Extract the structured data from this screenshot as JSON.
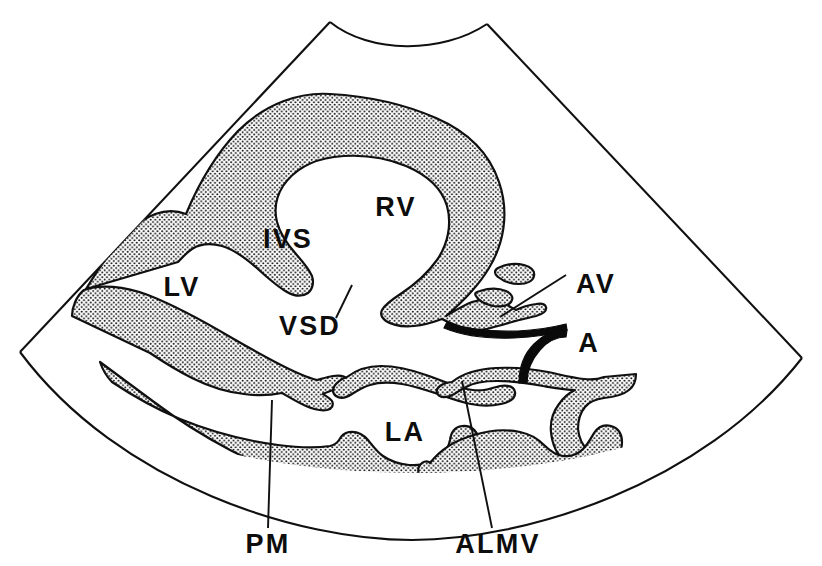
{
  "figure": {
    "kind": "echocardiogram-line-diagram",
    "background_color": "#ffffff",
    "ink_color": "#101010",
    "tissue_fill": "stippled"
  },
  "annotations": [
    {
      "id": "rv",
      "label": "RV",
      "x": 396,
      "y": 216,
      "anchor": "middle",
      "has_leader": false
    },
    {
      "id": "ivs",
      "label": "IVS",
      "x": 288,
      "y": 248,
      "anchor": "middle",
      "has_leader": false
    },
    {
      "id": "lv",
      "label": "LV",
      "x": 182,
      "y": 296,
      "anchor": "middle",
      "has_leader": false
    },
    {
      "id": "vsd",
      "label": "VSD",
      "x": 310,
      "y": 335,
      "anchor": "middle",
      "has_leader": true
    },
    {
      "id": "av",
      "label": "AV",
      "x": 596,
      "y": 293,
      "anchor": "middle",
      "has_leader": true
    },
    {
      "id": "a",
      "label": "A",
      "x": 589,
      "y": 352,
      "anchor": "middle",
      "has_leader": false
    },
    {
      "id": "la",
      "label": "LA",
      "x": 405,
      "y": 441,
      "anchor": "middle",
      "has_leader": false
    },
    {
      "id": "pm",
      "label": "PM",
      "x": 268,
      "y": 553,
      "anchor": "middle",
      "has_leader": true
    },
    {
      "id": "almv",
      "label": "ALMV",
      "x": 498,
      "y": 553,
      "anchor": "middle",
      "has_leader": true
    }
  ],
  "legend_expansions": {
    "RV": "right ventricle",
    "IVS": "interventricular septum",
    "LV": "left ventricle",
    "VSD": "ventricular septal defect",
    "AV": "aortic valve",
    "A": "aorta",
    "LA": "left atrium",
    "PM": "papillary muscle",
    "ALMV": "anterior leaflet of mitral valve"
  }
}
